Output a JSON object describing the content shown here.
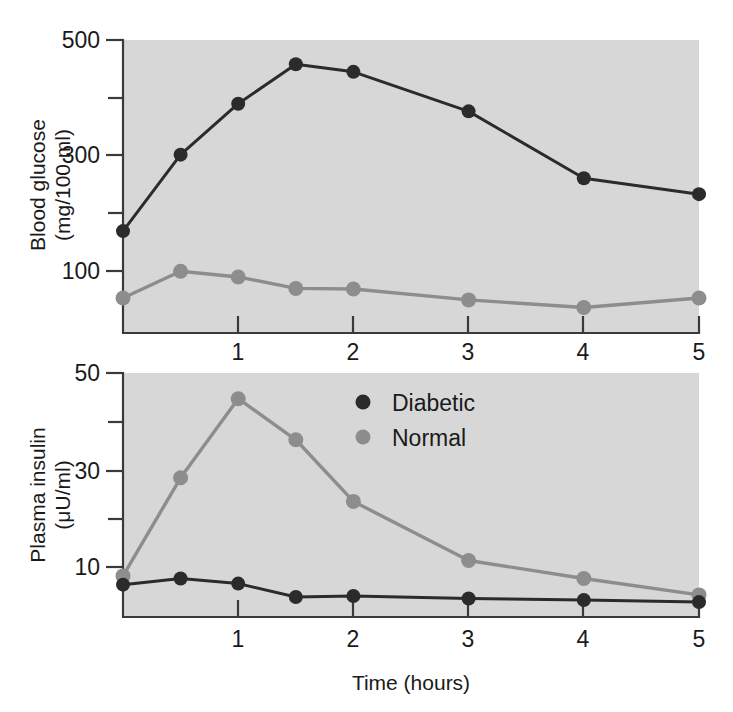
{
  "figure": {
    "background_color": "#ffffff",
    "panel_color": "#d7d7d7",
    "shared_x_axis_label": "Time (hours)",
    "x_tick_labels": [
      "1",
      "2",
      "3",
      "4",
      "5"
    ]
  },
  "legend": {
    "position": "inside-lower-panel-top-center",
    "entries": [
      {
        "label": "Diabetic",
        "color": "#2b2b2b",
        "marker": "filled-circle"
      },
      {
        "label": "Normal",
        "color": "#8d8d8d",
        "marker": "filled-circle"
      }
    ]
  },
  "panels": {
    "top": {
      "y_axis_label_line1": "Blood glucose",
      "y_axis_label_line2": "(mg/100 ml)",
      "y_tick_labels": [
        "500",
        "300",
        "100"
      ]
    },
    "bottom": {
      "y_axis_label_line1": "Plasma insulin",
      "y_axis_label_line2": "(μU/ml)",
      "y_tick_labels": [
        "50",
        "30",
        "10"
      ]
    }
  },
  "chart_data": [
    {
      "type": "line",
      "title": "",
      "panel": "top",
      "xlabel": "Time (hours)",
      "ylabel": "Blood glucose (mg/100 ml)",
      "x": [
        0,
        0.5,
        1,
        1.5,
        2,
        3,
        4,
        5
      ],
      "xlim": [
        0,
        5
      ],
      "ylim": [
        40,
        500
      ],
      "x_ticks": [
        1,
        2,
        3,
        4,
        5
      ],
      "y_ticks": [
        100,
        200,
        300,
        400,
        500
      ],
      "y_tick_labels_shown": [
        100,
        300,
        500
      ],
      "grid": false,
      "series": [
        {
          "name": "Diabetic",
          "color": "#2b2b2b",
          "values": [
            200,
            320,
            400,
            462,
            450,
            388,
            283,
            258
          ]
        },
        {
          "name": "Normal",
          "color": "#8d8d8d",
          "values": [
            95,
            137,
            128,
            110,
            109,
            92,
            80,
            95
          ]
        }
      ]
    },
    {
      "type": "line",
      "title": "",
      "panel": "bottom",
      "xlabel": "Time (hours)",
      "ylabel": "Plasma insulin (μU/ml)",
      "x": [
        0,
        0.5,
        1,
        1.5,
        2,
        3,
        4,
        5
      ],
      "xlim": [
        0,
        5
      ],
      "ylim": [
        2.5,
        50
      ],
      "x_ticks": [
        1,
        2,
        3,
        4,
        5
      ],
      "y_ticks": [
        10,
        20,
        30,
        40,
        50
      ],
      "y_tick_labels_shown": [
        10,
        30,
        50
      ],
      "grid": false,
      "series": [
        {
          "name": "Diabetic",
          "color": "#2b2b2b",
          "values": [
            8.8,
            10.0,
            9.0,
            6.4,
            6.6,
            6.1,
            5.8,
            5.4
          ]
        },
        {
          "name": "Normal",
          "color": "#8d8d8d",
          "values": [
            10.5,
            29.6,
            45.0,
            37.0,
            25.0,
            13.5,
            10.0,
            6.8
          ]
        }
      ]
    }
  ]
}
